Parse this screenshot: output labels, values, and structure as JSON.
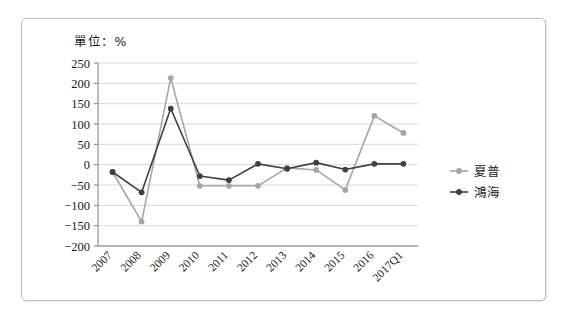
{
  "chart_data": {
    "type": "line",
    "title": "單位：%",
    "xlabel": "",
    "ylabel": "",
    "ylim": [
      -200,
      250
    ],
    "ytick_step": 50,
    "yticks": [
      "250",
      "200",
      "150",
      "100",
      "50",
      "0",
      "-50",
      "-100",
      "-150",
      "-200"
    ],
    "grid": true,
    "legend_position": "right",
    "categories": [
      "2007",
      "2008",
      "2009",
      "2010",
      "2011",
      "2012",
      "2013",
      "2014",
      "2015",
      "2016",
      "2017Q1"
    ],
    "series": [
      {
        "name": "夏普",
        "color": "#a6a6a6",
        "values": [
          -18,
          -140,
          213,
          -52,
          -52,
          -52,
          -8,
          -13,
          -62,
          120,
          78
        ]
      },
      {
        "name": "鴻海",
        "color": "#404040",
        "values": [
          -18,
          -68,
          138,
          -28,
          -38,
          2,
          -10,
          5,
          -12,
          2,
          2
        ]
      }
    ]
  },
  "legend": {
    "items": [
      {
        "label": "夏普",
        "color": "#a6a6a6"
      },
      {
        "label": "鴻海",
        "color": "#404040"
      }
    ]
  }
}
